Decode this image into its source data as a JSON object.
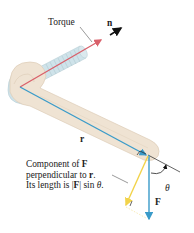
{
  "labels": {
    "torque": "Torque",
    "n": "n",
    "r": "r",
    "F": "F",
    "theta": "θ"
  },
  "caption": {
    "line1_prefix": "Component of ",
    "line1_bold": "F",
    "line2_prefix": "perpendicular to ",
    "line2_bold": "r",
    "line2_suffix": ".",
    "line3_prefix": "Its length is |",
    "line3_bold": "F",
    "line3_mid": "| sin ",
    "line3_theta": "θ",
    "line3_suffix": "."
  },
  "colors": {
    "torque_arrow": "#d9606a",
    "r_vector": "#3a9bc9",
    "force_vector": "#3a9bc9",
    "perp_component": "#f2d34a",
    "wrench": "#efe3d3",
    "bolt": "#cfe3ea",
    "normal_arrow": "#111111"
  }
}
